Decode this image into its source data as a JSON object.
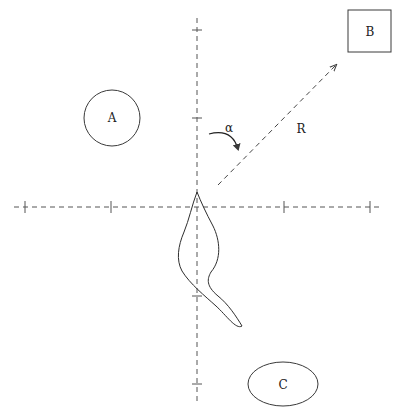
{
  "diagram": {
    "colors": {
      "stroke": "#3a3a3a",
      "background": "#ffffff"
    },
    "axes": {
      "vertical": {
        "x": 197,
        "y1": 18,
        "y2": 402,
        "ticks": [
          30,
          118,
          296,
          384
        ]
      },
      "horizontal": {
        "y": 207,
        "x1": 14,
        "x2": 381,
        "ticks": [
          25,
          111,
          284,
          370
        ]
      }
    },
    "objects": [
      {
        "id": "A",
        "label": "A",
        "shape": "circle"
      },
      {
        "id": "B",
        "label": "B",
        "shape": "square"
      },
      {
        "id": "C",
        "label": "C",
        "shape": "ellipse"
      }
    ],
    "vector": {
      "label": "R"
    },
    "angle": {
      "label": "α"
    }
  }
}
